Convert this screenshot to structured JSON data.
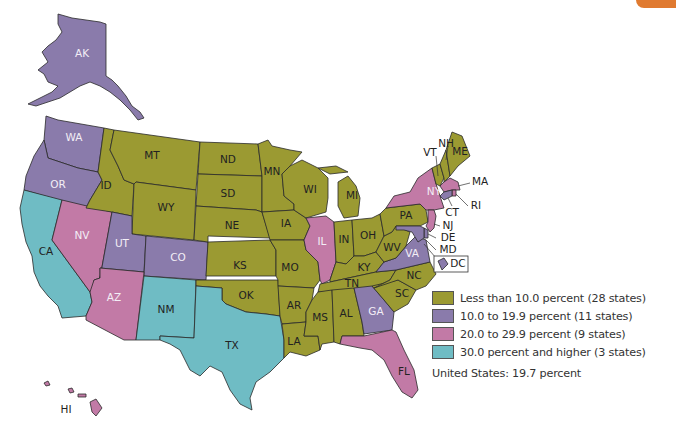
{
  "map": {
    "title": "",
    "colors": {
      "low": "#9b9a32",
      "mid": "#8a7bab",
      "high": "#c27aa6",
      "top": "#6fbcc4",
      "accent_tab": "#e07a30"
    },
    "states": [
      {
        "abbr": "AK",
        "category": "mid"
      },
      {
        "abbr": "WA",
        "category": "mid"
      },
      {
        "abbr": "OR",
        "category": "mid"
      },
      {
        "abbr": "CA",
        "category": "top"
      },
      {
        "abbr": "NV",
        "category": "high"
      },
      {
        "abbr": "ID",
        "category": "low"
      },
      {
        "abbr": "MT",
        "category": "low"
      },
      {
        "abbr": "WY",
        "category": "low"
      },
      {
        "abbr": "UT",
        "category": "mid"
      },
      {
        "abbr": "CO",
        "category": "mid"
      },
      {
        "abbr": "AZ",
        "category": "high"
      },
      {
        "abbr": "NM",
        "category": "top"
      },
      {
        "abbr": "ND",
        "category": "low"
      },
      {
        "abbr": "SD",
        "category": "low"
      },
      {
        "abbr": "NE",
        "category": "low"
      },
      {
        "abbr": "KS",
        "category": "low"
      },
      {
        "abbr": "OK",
        "category": "low"
      },
      {
        "abbr": "TX",
        "category": "top"
      },
      {
        "abbr": "MN",
        "category": "low"
      },
      {
        "abbr": "IA",
        "category": "low"
      },
      {
        "abbr": "MO",
        "category": "low"
      },
      {
        "abbr": "AR",
        "category": "low"
      },
      {
        "abbr": "LA",
        "category": "low"
      },
      {
        "abbr": "WI",
        "category": "low"
      },
      {
        "abbr": "IL",
        "category": "high"
      },
      {
        "abbr": "MI",
        "category": "low"
      },
      {
        "abbr": "IN",
        "category": "low"
      },
      {
        "abbr": "OH",
        "category": "low"
      },
      {
        "abbr": "KY",
        "category": "low"
      },
      {
        "abbr": "TN",
        "category": "low"
      },
      {
        "abbr": "MS",
        "category": "low"
      },
      {
        "abbr": "AL",
        "category": "low"
      },
      {
        "abbr": "GA",
        "category": "mid"
      },
      {
        "abbr": "FL",
        "category": "high"
      },
      {
        "abbr": "SC",
        "category": "low"
      },
      {
        "abbr": "NC",
        "category": "low"
      },
      {
        "abbr": "VA",
        "category": "mid"
      },
      {
        "abbr": "WV",
        "category": "low"
      },
      {
        "abbr": "PA",
        "category": "low"
      },
      {
        "abbr": "NY",
        "category": "high"
      },
      {
        "abbr": "VT",
        "category": "low"
      },
      {
        "abbr": "NH",
        "category": "low"
      },
      {
        "abbr": "ME",
        "category": "low"
      },
      {
        "abbr": "MA",
        "category": "high"
      },
      {
        "abbr": "RI",
        "category": "high"
      },
      {
        "abbr": "CT",
        "category": "mid"
      },
      {
        "abbr": "NJ",
        "category": "high"
      },
      {
        "abbr": "DE",
        "category": "mid"
      },
      {
        "abbr": "MD",
        "category": "mid"
      },
      {
        "abbr": "DC",
        "category": "mid"
      },
      {
        "abbr": "HI",
        "category": "high"
      }
    ]
  },
  "legend": {
    "items": [
      {
        "label": "Less than 10.0 percent (28 states)",
        "color": "#9b9a32"
      },
      {
        "label": "10.0 to 19.9 percent (11 states)",
        "color": "#8a7bab"
      },
      {
        "label": "20.0 to 29.9 percent (9 states)",
        "color": "#c27aa6"
      },
      {
        "label": "30.0 percent and higher (3 states)",
        "color": "#6fbcc4"
      }
    ],
    "total": "United States: 19.7 percent"
  }
}
